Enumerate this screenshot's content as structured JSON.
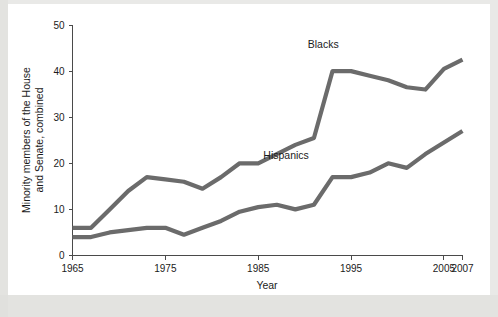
{
  "chart_data": {
    "type": "line",
    "title": "",
    "xlabel": "Year",
    "ylabel": "Minority members of the House and Senate, combined",
    "xlim": [
      1965,
      2007
    ],
    "ylim": [
      0,
      50
    ],
    "grid": false,
    "legend_position": "inline-labels",
    "xticks": [
      1965,
      1975,
      1985,
      1995,
      2005,
      2007
    ],
    "xtick_labels": [
      "1965",
      "1975",
      "1985",
      "1995",
      "2005",
      "2007"
    ],
    "yticks": [
      0,
      10,
      20,
      30,
      40,
      50
    ],
    "ytick_labels": [
      "0",
      "10",
      "20",
      "30",
      "40",
      "50"
    ],
    "line_color": "#6b6b6b",
    "series": [
      {
        "name": "Blacks",
        "label_x": 1992,
        "label_y": 45,
        "x": [
          1965,
          1967,
          1969,
          1971,
          1973,
          1975,
          1977,
          1979,
          1981,
          1983,
          1985,
          1987,
          1989,
          1991,
          1993,
          1995,
          1997,
          1999,
          2001,
          2003,
          2005,
          2007
        ],
        "values": [
          6,
          6,
          10,
          14,
          17,
          16.5,
          16,
          14.5,
          17,
          20,
          20,
          22,
          24,
          25.5,
          40,
          40,
          39,
          38,
          36.5,
          36,
          40.5,
          42.5
        ]
      },
      {
        "name": "Hispanics",
        "label_x": 1988,
        "label_y": 21,
        "x": [
          1965,
          1967,
          1969,
          1971,
          1973,
          1975,
          1977,
          1979,
          1981,
          1983,
          1985,
          1987,
          1989,
          1991,
          1993,
          1995,
          1997,
          1999,
          2001,
          2003,
          2005,
          2007
        ],
        "values": [
          4,
          4,
          5,
          5.5,
          6,
          6,
          4.5,
          6,
          7.5,
          9.5,
          10.5,
          11,
          10,
          11,
          17,
          17,
          18,
          20,
          19,
          22,
          24.5,
          27
        ]
      }
    ]
  },
  "axis": {
    "x_title": "Year",
    "y_title_line1": "Minority members of the House",
    "y_title_line2": "and Senate, combined"
  }
}
